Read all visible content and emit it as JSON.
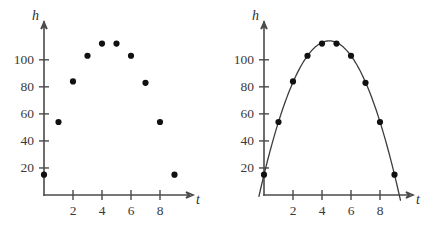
{
  "figure": {
    "panel_count": 2,
    "background_color": "#ffffff",
    "point_color": "#111111",
    "axis_color": "#4a4a4a",
    "curve_color": "#3c3c3c"
  },
  "panels": {
    "left": {
      "name": "scatter-only",
      "xlabel": "t",
      "ylabel": "h",
      "has_curve": false
    },
    "right": {
      "name": "scatter-with-fitted-curve",
      "xlabel": "t",
      "ylabel": "h",
      "has_curve": true
    }
  },
  "axes": {
    "x_ticks": [
      2,
      4,
      6,
      8
    ],
    "x_tick_labels": [
      "2",
      "4",
      "6",
      "8"
    ],
    "y_ticks": [
      20,
      40,
      60,
      80,
      100
    ],
    "y_tick_labels": [
      "20",
      "40",
      "60",
      "80",
      "100"
    ],
    "xlim": [
      0,
      10
    ],
    "ylim": [
      0,
      125
    ]
  },
  "chart_data": [
    {
      "type": "scatter",
      "title": "",
      "xlabel": "t",
      "ylabel": "h",
      "x": [
        0,
        1,
        2,
        3,
        4,
        5,
        6,
        7,
        8,
        9
      ],
      "values": [
        15,
        54,
        84,
        103,
        112,
        112,
        103,
        83,
        54,
        15
      ],
      "series": [
        {
          "name": "h",
          "values": [
            15,
            54,
            84,
            103,
            112,
            112,
            103,
            83,
            54,
            15
          ]
        }
      ],
      "xlim": [
        0,
        10
      ],
      "ylim": [
        0,
        125
      ],
      "xticks": [
        2,
        4,
        6,
        8
      ],
      "yticks": [
        20,
        40,
        60,
        80,
        100
      ],
      "grid": false,
      "legend": false
    },
    {
      "type": "line",
      "title": "",
      "xlabel": "t",
      "ylabel": "h",
      "x": [
        0,
        1,
        2,
        3,
        4,
        5,
        6,
        7,
        8,
        9
      ],
      "values": [
        15,
        54,
        84,
        103,
        112,
        112,
        103,
        83,
        54,
        15
      ],
      "series": [
        {
          "name": "h",
          "values": [
            15,
            54,
            84,
            103,
            112,
            112,
            103,
            83,
            54,
            15
          ]
        }
      ],
      "fitted_curve": {
        "shape": "parabola",
        "vertex_x": 4.5,
        "vertex_y": 114
      },
      "xlim": [
        0,
        10
      ],
      "ylim": [
        0,
        125
      ],
      "xticks": [
        2,
        4,
        6,
        8
      ],
      "yticks": [
        20,
        40,
        60,
        80,
        100
      ],
      "grid": false,
      "legend": false
    }
  ]
}
